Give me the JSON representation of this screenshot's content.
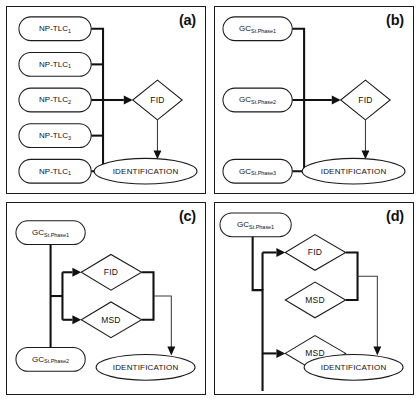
{
  "figure": {
    "kind": "analytical-workflow-flowchart",
    "panel_count": 4,
    "width": 420,
    "height": 401,
    "colors": {
      "background": "#ffffff",
      "stroke": "#1a1a1a",
      "text": "#111111",
      "connector_thick": "#111111",
      "connector_thin": "#3a3a3a"
    }
  },
  "panels": [
    {
      "id": "a",
      "label": "(a)",
      "sources": [
        {
          "base": "NP-TLC",
          "sub": "1"
        },
        {
          "base": "NP-TLC",
          "sub": "1"
        },
        {
          "base": "NP-TLC",
          "sub": "2"
        },
        {
          "base": "NP-TLC",
          "sub": "3"
        },
        {
          "base": "NP-TLC",
          "sub": "1"
        }
      ],
      "detectors": [
        "FID"
      ],
      "output": "IDENTIFICATION"
    },
    {
      "id": "b",
      "label": "(b)",
      "sources": [
        {
          "base": "GC",
          "sub": "St.Phase1"
        },
        {
          "base": "GC",
          "sub": "St.Phase2"
        },
        {
          "base": "GC",
          "sub": "St.Phase3"
        }
      ],
      "detectors": [
        "FID"
      ],
      "output": "IDENTIFICATION"
    },
    {
      "id": "c",
      "label": "(c)",
      "sources": [
        {
          "base": "GC",
          "sub": "St.Phase1"
        },
        {
          "base": "GC",
          "sub": "St.Phase2"
        }
      ],
      "detectors": [
        "FID",
        "MSD"
      ],
      "output": "IDENTIFICATION"
    },
    {
      "id": "d",
      "label": "(d)",
      "sources": [
        {
          "base": "GC",
          "sub": "St.Phase1"
        }
      ],
      "detectors": [
        "FID",
        "MSD",
        "MSD"
      ],
      "output": "IDENTIFICATION"
    }
  ]
}
